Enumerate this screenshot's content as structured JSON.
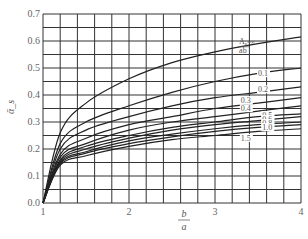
{
  "chart_data": {
    "type": "line",
    "title": "",
    "xlabel": "b/a",
    "xlabel_num": "b",
    "xlabel_den": "a",
    "ylabel": "ᾱ_s",
    "xlim": [
      1,
      4
    ],
    "ylim": [
      0,
      0.7
    ],
    "grid": true,
    "grid_x_step": 0.2,
    "grid_y_step": 0.05,
    "x_ticks": [
      "1",
      "2",
      "3",
      "4"
    ],
    "y_ticks": [
      "0.0",
      "0.1",
      "0.2",
      "0.3",
      "0.4",
      "0.5",
      "0.6",
      "0.7"
    ],
    "legend": "inline curve labels (A_s/ab ratio)",
    "x": [
      1,
      1.2,
      1.5,
      2,
      2.5,
      3,
      3.5,
      4
    ],
    "series": [
      {
        "name": "A_s/ab = ∞",
        "label": "∞",
        "values": [
          0,
          0.26,
          0.37,
          0.46,
          0.52,
          0.56,
          0.59,
          0.615
        ]
      },
      {
        "name": "0.1",
        "label": "0.1",
        "values": [
          0,
          0.22,
          0.3,
          0.36,
          0.41,
          0.45,
          0.48,
          0.5
        ]
      },
      {
        "name": "0.2",
        "label": "0.2",
        "values": [
          0,
          0.2,
          0.27,
          0.32,
          0.36,
          0.39,
          0.41,
          0.43
        ]
      },
      {
        "name": "0.3",
        "label": "0.3",
        "values": [
          0,
          0.18,
          0.24,
          0.29,
          0.32,
          0.35,
          0.37,
          0.39
        ]
      },
      {
        "name": "0.4",
        "label": "0.4",
        "values": [
          0,
          0.17,
          0.22,
          0.27,
          0.3,
          0.32,
          0.34,
          0.36
        ]
      },
      {
        "name": "0.5",
        "label": "0.5",
        "values": [
          0,
          0.16,
          0.21,
          0.25,
          0.28,
          0.3,
          0.32,
          0.33
        ]
      },
      {
        "name": "0.6",
        "label": "0.6",
        "values": [
          0,
          0.155,
          0.2,
          0.24,
          0.27,
          0.29,
          0.305,
          0.32
        ]
      },
      {
        "name": "0.8",
        "label": "0.8",
        "values": [
          0,
          0.15,
          0.19,
          0.23,
          0.255,
          0.275,
          0.29,
          0.3
        ]
      },
      {
        "name": "1.0",
        "label": "1.0",
        "values": [
          0,
          0.145,
          0.185,
          0.22,
          0.245,
          0.265,
          0.28,
          0.29
        ]
      },
      {
        "name": "1.5",
        "label": "1.5",
        "values": [
          0,
          0.14,
          0.175,
          0.21,
          0.235,
          0.25,
          0.265,
          0.275
        ]
      }
    ],
    "annotation_top_curve": "A_s/ab = ∞",
    "label_positions": [
      {
        "label": "A_s/ab=∞",
        "x": 3.28,
        "y": 0.575
      },
      {
        "label": "0.1",
        "x": 3.5,
        "y": 0.47
      },
      {
        "label": "0.2",
        "x": 3.5,
        "y": 0.41
      },
      {
        "label": "0.3",
        "x": 3.3,
        "y": 0.37
      },
      {
        "label": "0.4",
        "x": 3.3,
        "y": 0.34
      },
      {
        "label": "0.5",
        "x": 3.55,
        "y": 0.315
      },
      {
        "label": "0.6",
        "x": 3.55,
        "y": 0.3
      },
      {
        "label": "0.8",
        "x": 3.55,
        "y": 0.285
      },
      {
        "label": "1.0",
        "x": 3.55,
        "y": 0.27
      },
      {
        "label": "1.5",
        "x": 3.3,
        "y": 0.23
      }
    ]
  }
}
